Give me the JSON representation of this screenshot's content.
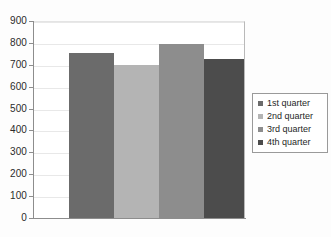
{
  "chart_data": {
    "type": "bar",
    "title": "",
    "subtitle": "",
    "xlabel": "",
    "ylabel": "",
    "categories": [
      "1st quarter",
      "2nd quarter",
      "3rd quarter",
      "4th quarter"
    ],
    "values": [
      755,
      700,
      795,
      725
    ],
    "series": [
      {
        "name": "quarters",
        "values": [
          755,
          700,
          795,
          725
        ]
      }
    ],
    "colors": [
      "#6b6b6b",
      "#b4b4b4",
      "#8d8d8d",
      "#4c4c4c"
    ],
    "ylim": [
      0,
      900
    ],
    "y_ticks": [
      0,
      100,
      200,
      300,
      400,
      500,
      600,
      700,
      800,
      900
    ],
    "y_tick_labels": [
      "0",
      "100",
      "200",
      "300",
      "400",
      "500",
      "600",
      "700",
      "800",
      "900"
    ],
    "x_tick_labels": [],
    "grid": true,
    "grid_axis": "y",
    "legend_position": "right",
    "legend": [
      {
        "label": "1st quarter",
        "color": "#6b6b6b"
      },
      {
        "label": "2nd quarter",
        "color": "#b4b4b4"
      },
      {
        "label": "3rd quarter",
        "color": "#8d8d8d"
      },
      {
        "label": "4th quarter",
        "color": "#4c4c4c"
      }
    ]
  },
  "axis": {
    "y_axis_color": "#8d8d8d",
    "x_axis_color": "#8d8d8d",
    "gridline_color": "#e8e8e8",
    "plot_background": "#ffffff"
  }
}
